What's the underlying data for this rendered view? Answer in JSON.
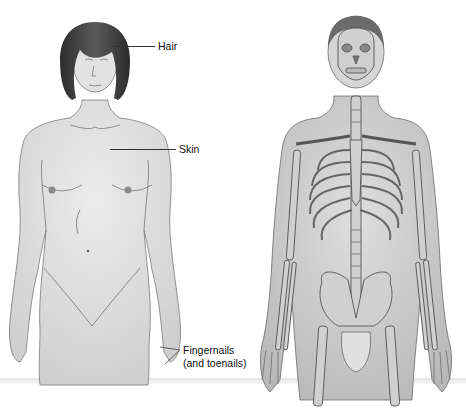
{
  "figure": {
    "left_panel": {
      "subject": "female-figure",
      "system": "integumentary",
      "labels": [
        {
          "text": "Hair"
        },
        {
          "text": "Skin"
        },
        {
          "text_line1": "Fingernails",
          "text_line2": "(and toenails)"
        }
      ]
    },
    "right_panel": {
      "subject": "male-figure-with-skeleton",
      "system": "skeletal"
    },
    "colors": {
      "background": "#ffffff",
      "skin": "#e4e4e4",
      "skin_shadow": "#bdbdbd",
      "outline": "#6a6a6a",
      "hair": "#3a3a3a",
      "bone": "#cfcfcf",
      "text": "#111111"
    }
  }
}
